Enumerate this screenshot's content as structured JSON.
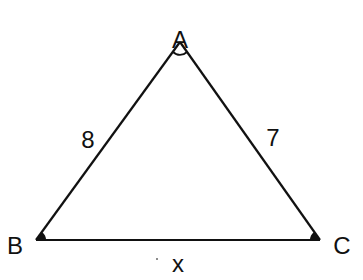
{
  "diagram": {
    "type": "triangle",
    "colors": {
      "stroke": "#111111",
      "background": "#ffffff"
    },
    "vertices": {
      "A": {
        "label": "A",
        "x": 180,
        "y": 42
      },
      "B": {
        "label": "B",
        "x": 36,
        "y": 240
      },
      "C": {
        "label": "C",
        "x": 320,
        "y": 240
      }
    },
    "sides": {
      "AB": {
        "label": "8"
      },
      "AC": {
        "label": "7"
      },
      "BC": {
        "label": "x"
      }
    },
    "angle_marks": [
      "A",
      "B",
      "C"
    ]
  }
}
